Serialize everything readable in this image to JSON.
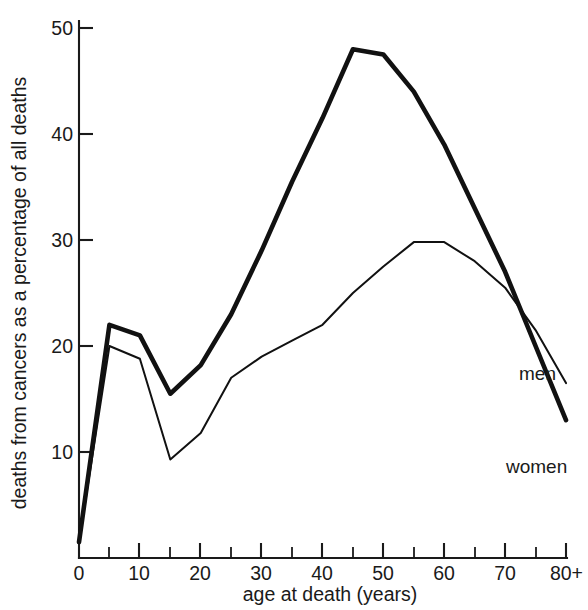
{
  "chart_data": {
    "type": "line",
    "title": "",
    "xlabel": "age at death (years)",
    "ylabel": "deaths from cancers as a percentage of all deaths",
    "xlim": [
      0,
      80
    ],
    "ylim": [
      0,
      50
    ],
    "grid": false,
    "legend_position": "at line ends (right)",
    "x_tick_labels": [
      "0",
      "10",
      "20",
      "30",
      "40",
      "50",
      "60",
      "70",
      "80+"
    ],
    "x_tick_values": [
      0,
      10,
      20,
      30,
      40,
      50,
      60,
      70,
      80
    ],
    "x_minor_tick_values": [
      5,
      15,
      25,
      35,
      45,
      55,
      65,
      75
    ],
    "y_tick_labels": [
      "10",
      "20",
      "30",
      "40",
      "50"
    ],
    "y_tick_values": [
      10,
      20,
      30,
      40,
      50
    ],
    "x": [
      0,
      5,
      10,
      15,
      20,
      25,
      30,
      35,
      40,
      45,
      50,
      55,
      60,
      65,
      70,
      75,
      80
    ],
    "series": [
      {
        "name": "men",
        "label": "men",
        "line_weight": "thick",
        "values": [
          1.5,
          22.0,
          21.0,
          15.5,
          18.2,
          23.0,
          29.0,
          35.5,
          41.5,
          48.0,
          47.5,
          44.0,
          39.0,
          33.0,
          27.0,
          20.0,
          13.0
        ]
      },
      {
        "name": "women",
        "label": "women",
        "line_weight": "thin",
        "values": [
          1.5,
          20.0,
          18.8,
          9.3,
          11.8,
          17.0,
          19.0,
          20.5,
          22.0,
          25.0,
          27.5,
          29.8,
          29.8,
          28.0,
          25.5,
          21.5,
          16.5
        ]
      }
    ],
    "annotations": [
      {
        "text": "men",
        "at_x": 80,
        "at_y": 20.0
      },
      {
        "text": "women",
        "at_x": 80,
        "at_y": 13.0
      }
    ]
  },
  "axes": {
    "y_title": "deaths from cancers as a percentage of all deaths",
    "x_title": "age at death (years)"
  }
}
